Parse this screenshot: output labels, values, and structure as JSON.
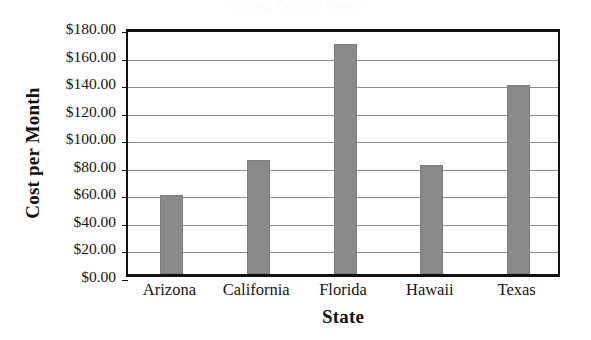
{
  "chart_data": {
    "type": "bar",
    "title": "",
    "xlabel": "State",
    "ylabel": "Cost per Month",
    "categories": [
      "Arizona",
      "California",
      "Florida",
      "Hawaii",
      "Texas"
    ],
    "values": [
      57,
      83,
      167,
      79,
      137
    ],
    "ylim": [
      0,
      180
    ],
    "ytick_step": 20,
    "ytick_labels": [
      "$180.00",
      "$160.00",
      "$140.00",
      "$120.00",
      "$100.00",
      "$80.00",
      "$60.00",
      "$40.00",
      "$20.00",
      "$0.00"
    ],
    "ytick_values": [
      180,
      160,
      140,
      120,
      100,
      80,
      60,
      40,
      20,
      0
    ],
    "grid": "horizontal",
    "legend": "none",
    "bar_color": "#8a8a8a",
    "frame_color": "#111111",
    "gridline_color": "#8e8e8e",
    "background": "#ffffff"
  },
  "ghost_title": "Average Cost per Month"
}
